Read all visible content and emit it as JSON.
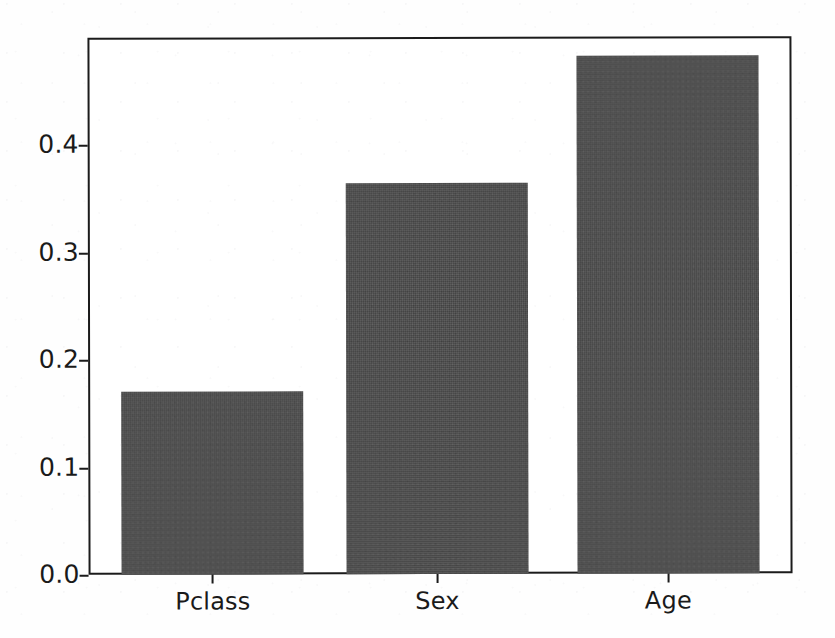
{
  "chart_data": {
    "type": "bar",
    "title": "",
    "xlabel": "",
    "ylabel": "",
    "categories": [
      "Pclass",
      "Sex",
      "Age"
    ],
    "values": [
      0.17,
      0.364,
      0.482
    ],
    "series": [
      {
        "name": "feature importance",
        "values": [
          0.17,
          0.364,
          0.482
        ]
      }
    ],
    "ylim": [
      0.0,
      0.5
    ],
    "yticks": [
      0.0,
      0.1,
      0.2,
      0.3,
      0.4
    ],
    "ytick_labels": [
      "0.0",
      "0.1",
      "0.2",
      "0.3",
      "0.4"
    ],
    "xtick_labels": [
      "Pclass",
      "Sex",
      "Age"
    ],
    "grid": false,
    "legend": false,
    "legend_position": "none",
    "bar_color": "#4b4b4b",
    "axis_color": "#1b1b1b",
    "background_color": "#ffffff"
  }
}
